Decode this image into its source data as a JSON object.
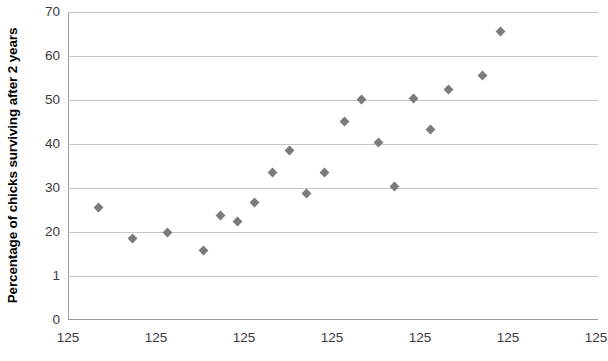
{
  "chart_data": {
    "type": "scatter",
    "title": "",
    "xlabel": "",
    "ylabel": "Percentage of chicks surviving after 2 years",
    "ylim": [
      0,
      70
    ],
    "y_ticks": [
      "0",
      "1",
      "20",
      "30",
      "40",
      "50",
      "60",
      "70"
    ],
    "y_tick_values": [
      0,
      10,
      20,
      30,
      40,
      50,
      60,
      70
    ],
    "x_ticks": [
      "125",
      "125",
      "125",
      "125",
      "125",
      "125",
      "125"
    ],
    "x_tick_positions": [
      68,
      156,
      244,
      332,
      420,
      508,
      596
    ],
    "grid": true,
    "legend": false,
    "marker": "diamond",
    "marker_color": "#7b7b7b",
    "points": [
      {
        "px": 98,
        "y": 25.5
      },
      {
        "px": 132,
        "y": 18.5
      },
      {
        "px": 167,
        "y": 20.0
      },
      {
        "px": 203,
        "y": 15.8
      },
      {
        "px": 220,
        "y": 23.8
      },
      {
        "px": 237,
        "y": 22.3
      },
      {
        "px": 254,
        "y": 26.6
      },
      {
        "px": 272,
        "y": 33.6
      },
      {
        "px": 289,
        "y": 38.5
      },
      {
        "px": 306,
        "y": 28.8
      },
      {
        "px": 324,
        "y": 33.6
      },
      {
        "px": 344,
        "y": 45.2
      },
      {
        "px": 361,
        "y": 50.2
      },
      {
        "px": 378,
        "y": 40.4
      },
      {
        "px": 394,
        "y": 30.4
      },
      {
        "px": 413,
        "y": 50.3
      },
      {
        "px": 430,
        "y": 43.4
      },
      {
        "px": 448,
        "y": 52.5
      },
      {
        "px": 482,
        "y": 55.5
      },
      {
        "px": 500,
        "y": 65.5
      }
    ]
  }
}
